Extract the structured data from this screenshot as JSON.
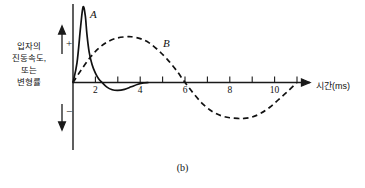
{
  "figure": {
    "caption": "(b)",
    "y_axis_title_lines": [
      "입자의",
      "진동속도,",
      "또는",
      "변형률"
    ],
    "x_axis_title": "시간(ms)",
    "positive_sign": "+",
    "negative_sign": "−"
  },
  "chart_data": {
    "type": "line",
    "title": "",
    "subtitle": "",
    "xlabel": "시간(ms)",
    "ylabel": "입자의 진동속도, 또는 변형률",
    "xlim": [
      0,
      11.8
    ],
    "ylim": [
      -1.3,
      2.3
    ],
    "xticks": [
      2,
      4,
      6,
      8,
      10
    ],
    "xtick_labels": [
      "2",
      "4",
      "6",
      "8",
      "10"
    ],
    "yticks": [],
    "ytick_labels": [],
    "grid": false,
    "legend": "inline-annotations",
    "annotations": [
      {
        "text": "A",
        "x": 0.95,
        "y": 2.05,
        "style": "italic-serif"
      },
      {
        "text": "B",
        "x": 5.05,
        "y": 1.2,
        "style": "italic-serif"
      },
      {
        "text": "+",
        "x": -0.95,
        "y": 1.35,
        "style": "serif"
      },
      {
        "text": "−",
        "x": -0.95,
        "y": -0.85,
        "style": "serif"
      }
    ],
    "series": [
      {
        "name": "A",
        "label": "A",
        "style": "solid",
        "color": "#111111",
        "description": "sharp impulsive spike from origin, rapid decay with small negative undershoot near 2 ms",
        "x": [
          0.0,
          0.18,
          0.34,
          0.45,
          0.55,
          0.62,
          0.72,
          0.85,
          1.0,
          1.15,
          1.3,
          1.5,
          1.75,
          2.0,
          2.3,
          2.6,
          2.9,
          3.15,
          3.35
        ],
        "y": [
          0.0,
          0.55,
          1.55,
          2.1,
          1.85,
          1.35,
          0.85,
          0.5,
          0.26,
          0.1,
          0.0,
          -0.12,
          -0.2,
          -0.22,
          -0.19,
          -0.12,
          -0.05,
          -0.01,
          0.0
        ]
      },
      {
        "name": "B",
        "label": "B",
        "style": "dashed",
        "color": "#111111",
        "description": "smooth single-cycle sinusoid, positive lobe peaking near 2.6 ms, zero crossing at 5 ms, negative trough near 7.5 ms, returning to zero at 10 ms",
        "x": [
          0.0,
          0.4,
          0.8,
          1.2,
          1.6,
          2.0,
          2.4,
          2.6,
          3.0,
          3.4,
          3.8,
          4.2,
          4.6,
          5.0,
          5.4,
          5.8,
          6.2,
          6.6,
          7.0,
          7.4,
          7.6,
          8.0,
          8.4,
          8.8,
          9.2,
          9.6,
          10.0
        ],
        "y": [
          0.0,
          0.38,
          0.72,
          0.98,
          1.15,
          1.24,
          1.27,
          1.27,
          1.22,
          1.1,
          0.9,
          0.65,
          0.35,
          0.0,
          -0.32,
          -0.6,
          -0.8,
          -0.92,
          -0.98,
          -1.0,
          -1.0,
          -0.96,
          -0.85,
          -0.68,
          -0.46,
          -0.24,
          0.0
        ]
      }
    ]
  }
}
